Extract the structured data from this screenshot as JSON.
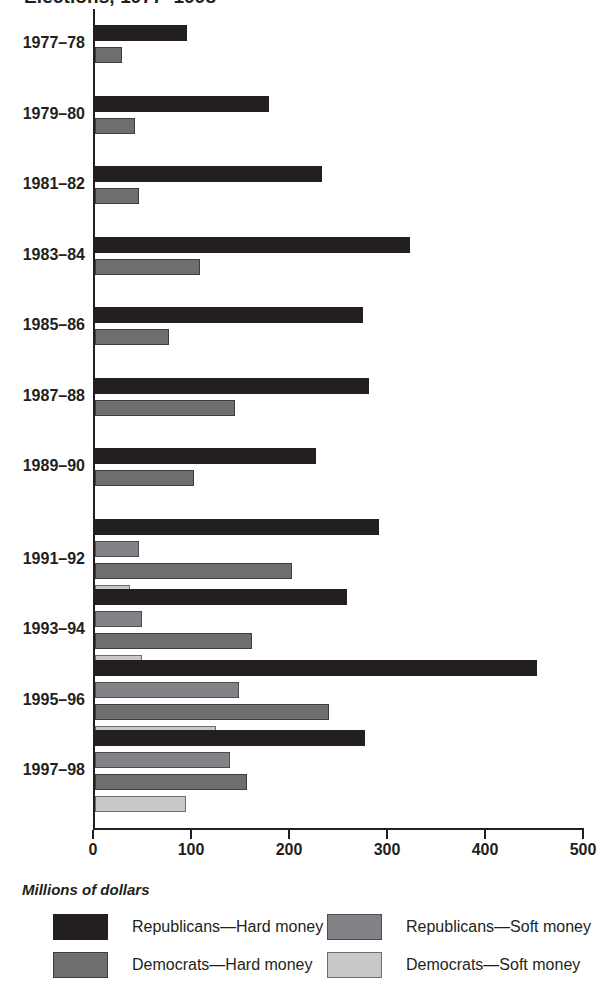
{
  "title": {
    "text_clipped": "Elections, 1977–1998"
  },
  "axis_caption": "Millions of dollars",
  "legend": {
    "position": "bottom",
    "items": [
      {
        "key": "rep_hard",
        "label": "Republicans—Hard money",
        "color": "#231f20"
      },
      {
        "key": "dem_hard",
        "label": "Democrats—Hard money",
        "color": "#6d6e70"
      },
      {
        "key": "rep_soft",
        "label": "Republicans—Soft money",
        "color": "#808285"
      },
      {
        "key": "dem_soft",
        "label": "Democrats—Soft money",
        "color": "#c7c8ca"
      }
    ]
  },
  "chart_data": {
    "type": "bar",
    "orientation": "horizontal",
    "title": "Elections, 1977–1998",
    "xlabel": "Millions of dollars",
    "ylabel": "",
    "xlim": [
      0,
      500
    ],
    "xticks": [
      0,
      100,
      200,
      300,
      400,
      500
    ],
    "xtick_labels": [
      "0",
      "100",
      "200",
      "300",
      "400",
      "500"
    ],
    "grid": false,
    "legend_position": "bottom",
    "categories": [
      "1977–78",
      "1979–80",
      "1981–82",
      "1983–84",
      "1985–86",
      "1987–88",
      "1989–90",
      "1991–92",
      "1993–94",
      "1995–96",
      "1997–98"
    ],
    "series": [
      {
        "name": "Republicans—Hard money",
        "color": "#231f20",
        "values": [
          94,
          178,
          232,
          321,
          273,
          280,
          226,
          290,
          257,
          451,
          276
        ]
      },
      {
        "name": "Republicans—Soft money",
        "color": "#808285",
        "values": [
          null,
          null,
          null,
          null,
          null,
          null,
          null,
          45,
          48,
          147,
          138
        ]
      },
      {
        "name": "Democrats—Hard money",
        "color": "#6d6e70",
        "values": [
          28,
          41,
          45,
          107,
          76,
          143,
          101,
          201,
          160,
          239,
          155
        ]
      },
      {
        "name": "Democrats—Soft money",
        "color": "#c7c8ca",
        "values": [
          null,
          null,
          null,
          null,
          null,
          null,
          null,
          36,
          48,
          123,
          93
        ]
      }
    ]
  }
}
